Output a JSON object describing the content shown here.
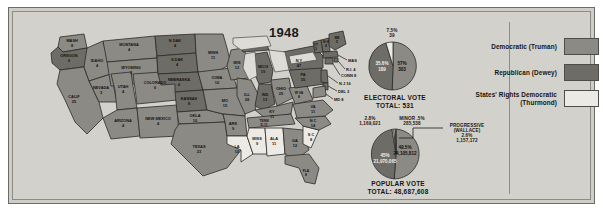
{
  "title": "1948",
  "colors": {
    "democratic": "#8c8a85",
    "republican": "#6e6c67",
    "states_rights": "#eceae5",
    "background": "#d3d1cc",
    "border": "#2b2b2b"
  },
  "legend": {
    "items": [
      {
        "label": "Democratic (Truman)",
        "swatch": "democratic"
      },
      {
        "label": "Republican (Dewey)",
        "swatch": "republican"
      },
      {
        "label": "States' Rights Democratic (Thurmond)",
        "swatch": "states_rights"
      }
    ]
  },
  "electoral": {
    "caption_line1": "ELECTORAL  VOTE",
    "caption_line2": "TOTAL:  531",
    "slices": [
      {
        "name": "Truman",
        "pct": "57%",
        "votes": "303",
        "share": 57.0,
        "party": "democratic"
      },
      {
        "name": "Dewey",
        "pct": "35.6%",
        "votes": "189",
        "share": 35.6,
        "party": "republican"
      },
      {
        "name": "Thurmond",
        "pct": "7.5%",
        "votes": "39",
        "share": 7.5,
        "party": "states_rights"
      }
    ],
    "top_label_pct": "7.5%",
    "top_label_votes": "39"
  },
  "popular": {
    "caption_line1": "POPULAR  VOTE",
    "caption_line2": "TOTAL:  48,687,608",
    "slices": [
      {
        "name": "Truman",
        "pct": "49.5%",
        "votes": "24,105,812",
        "share": 49.5,
        "party": "democratic"
      },
      {
        "name": "Dewey",
        "pct": "45%",
        "votes": "21,970,065",
        "share": 45.0,
        "party": "republican"
      },
      {
        "name": "Thurmond",
        "pct": "2.8%",
        "votes": "1,169,021",
        "share": 2.8,
        "party": "states_rights"
      },
      {
        "name": "Progressive (Wallace)",
        "pct": "2.6%",
        "votes": "1,157,172",
        "share": 2.6,
        "party": "states_rights"
      },
      {
        "name": "Minor",
        "pct": ".5%",
        "votes": "285,538",
        "share": 0.5,
        "party": "states_rights"
      }
    ],
    "anno_thurmond_pct": "2.8%",
    "anno_thurmond_votes": "1,169,021",
    "anno_minor_label": "MINOR .5%",
    "anno_minor_votes": "285,538",
    "anno_progressive_l1": "PROGRESSIVE",
    "anno_progressive_l2": "(WALLACE)",
    "anno_progressive_l3": "2.6%",
    "anno_progressive_l4": "1,157,172",
    "anno_dewey_pct": "45%",
    "anno_dewey_votes": "21,970,065",
    "anno_truman_pct": "49.5%",
    "anno_truman_votes": "24,105,812"
  },
  "map": {
    "states": [
      {
        "abbr": "WASH",
        "ev": "8",
        "party": "democratic"
      },
      {
        "abbr": "OREGON",
        "ev": "6",
        "party": "republican"
      },
      {
        "abbr": "CALIF",
        "ev": "25",
        "party": "democratic"
      },
      {
        "abbr": "IDAHO",
        "ev": "4",
        "party": "democratic"
      },
      {
        "abbr": "NEVADA",
        "ev": "3",
        "party": "democratic"
      },
      {
        "abbr": "MONTANA",
        "ev": "4",
        "party": "democratic"
      },
      {
        "abbr": "WYOMING",
        "ev": "3",
        "party": "democratic"
      },
      {
        "abbr": "UTAH",
        "ev": "4",
        "party": "democratic"
      },
      {
        "abbr": "ARIZONA",
        "ev": "4",
        "party": "democratic"
      },
      {
        "abbr": "COLORADO",
        "ev": "6",
        "party": "democratic"
      },
      {
        "abbr": "NEW MEXICO",
        "ev": "4",
        "party": "democratic"
      },
      {
        "abbr": "N DAK",
        "ev": "4",
        "party": "republican"
      },
      {
        "abbr": "S DAK",
        "ev": "4",
        "party": "republican"
      },
      {
        "abbr": "NEBRASKA",
        "ev": "6",
        "party": "republican"
      },
      {
        "abbr": "KANSAS",
        "ev": "8",
        "party": "republican"
      },
      {
        "abbr": "OKLA",
        "ev": "10",
        "party": "democratic"
      },
      {
        "abbr": "TEXAS",
        "ev": "23",
        "party": "democratic"
      },
      {
        "abbr": "MINN",
        "ev": "11",
        "party": "democratic"
      },
      {
        "abbr": "IOWA",
        "ev": "10",
        "party": "democratic"
      },
      {
        "abbr": "MO",
        "ev": "15",
        "party": "democratic"
      },
      {
        "abbr": "ARK",
        "ev": "9",
        "party": "democratic"
      },
      {
        "abbr": "LA",
        "ev": "10",
        "party": "states_rights"
      },
      {
        "abbr": "WIS",
        "ev": "12",
        "party": "democratic"
      },
      {
        "abbr": "ILL",
        "ev": "28",
        "party": "democratic"
      },
      {
        "abbr": "MICH",
        "ev": "19",
        "party": "republican"
      },
      {
        "abbr": "IND",
        "ev": "13",
        "party": "republican"
      },
      {
        "abbr": "OHIO",
        "ev": "25",
        "party": "democratic"
      },
      {
        "abbr": "KY",
        "ev": "11",
        "party": "democratic"
      },
      {
        "abbr": "TENN",
        "ev": "D-11",
        "party": "democratic"
      },
      {
        "abbr": "MISS",
        "ev": "9",
        "party": "states_rights"
      },
      {
        "abbr": "ALA",
        "ev": "11",
        "party": "states_rights"
      },
      {
        "abbr": "GA",
        "ev": "12",
        "party": "democratic"
      },
      {
        "abbr": "S C",
        "ev": "8",
        "party": "states_rights"
      },
      {
        "abbr": "N C",
        "ev": "14",
        "party": "democratic"
      },
      {
        "abbr": "VA",
        "ev": "11",
        "party": "democratic"
      },
      {
        "abbr": "W VA",
        "ev": "8",
        "party": "democratic"
      },
      {
        "abbr": "PA",
        "ev": "35",
        "party": "republican"
      },
      {
        "abbr": "N Y",
        "ev": "47",
        "party": "republican"
      },
      {
        "abbr": "VT",
        "ev": "3",
        "party": "republican"
      },
      {
        "abbr": "N H",
        "ev": "4",
        "party": "republican"
      },
      {
        "abbr": "ME",
        "ev": "5",
        "party": "republican"
      },
      {
        "abbr": "FLA",
        "ev": "8",
        "party": "democratic"
      }
    ],
    "callouts": [
      {
        "label": "MASS 16"
      },
      {
        "label": "R.I. 4"
      },
      {
        "label": "CONN 8"
      },
      {
        "label": "N J 16"
      },
      {
        "label": "DEL 3"
      },
      {
        "label": "MD 8"
      }
    ],
    "callout_mass": "MASS 16",
    "callout_ri": "R.I. 4",
    "callout_conn": "CONN 8",
    "callout_nj": "N J 16",
    "callout_del": "DEL 3",
    "callout_md": "MD 8"
  }
}
